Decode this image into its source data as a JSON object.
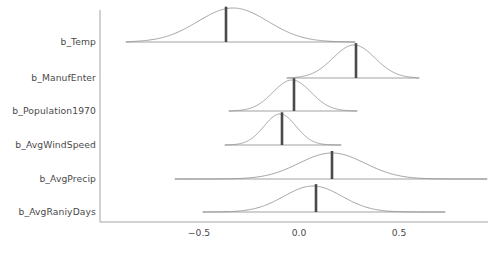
{
  "chart_data": {
    "type": "area",
    "subtype": "ridgeline-posterior-density",
    "title": "",
    "subtitle": "",
    "xlabel": "",
    "ylabel": "",
    "xlim": [
      -0.92,
      0.98
    ],
    "xticks": [
      -0.5,
      0.0,
      0.5
    ],
    "xticklabels": [
      "−0.5",
      "0.0",
      "0.5"
    ],
    "grid": false,
    "legend": null,
    "categories": [
      "b_Temp",
      "b_ManufEnter",
      "b_Population1970",
      "b_AvgWindSpeed",
      "b_AvgPrecip",
      "b_AvgRaniyDays"
    ],
    "series": [
      {
        "name": "b_Temp",
        "median": -0.365,
        "mode": -0.33,
        "sd": 0.175,
        "range": [
          -0.865,
          0.28
        ],
        "peak_height": 1.0
      },
      {
        "name": "b_ManufEnter",
        "median": 0.285,
        "mode": 0.275,
        "sd": 0.105,
        "range": [
          -0.06,
          0.6
        ],
        "peak_height": 1.0
      },
      {
        "name": "b_Population1970",
        "median": -0.025,
        "mode": -0.035,
        "sd": 0.095,
        "range": [
          -0.35,
          0.29
        ],
        "peak_height": 1.0
      },
      {
        "name": "b_AvgWindSpeed",
        "median": -0.085,
        "mode": -0.095,
        "sd": 0.08,
        "range": [
          -0.37,
          0.21
        ],
        "peak_height": 1.0
      },
      {
        "name": "b_AvgPrecip",
        "median": 0.165,
        "mode": 0.165,
        "sd": 0.165,
        "range": [
          -0.62,
          0.94
        ],
        "peak_height": 1.0
      },
      {
        "name": "b_AvgRaniyDays",
        "median": 0.085,
        "mode": 0.07,
        "sd": 0.145,
        "range": [
          -0.48,
          0.73
        ],
        "peak_height": 1.0
      }
    ],
    "colors": {
      "density_line": "#8c8c8c",
      "density_fill": "#ffffff",
      "median_bar": "#4a4a4a",
      "axis": "#9a9a9a",
      "text": "#4a4a4a",
      "background": "#ffffff"
    }
  },
  "axis": {
    "y_labels": [
      "b_Temp",
      "b_ManufEnter",
      "b_Population1970",
      "b_AvgWindSpeed",
      "b_AvgPrecip",
      "b_AvgRaniyDays"
    ],
    "x_tick_labels": [
      "−0.5",
      "0.0",
      "0.5"
    ]
  }
}
